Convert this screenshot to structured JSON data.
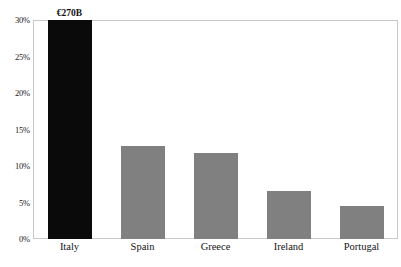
{
  "chart_data": {
    "type": "bar",
    "title": "",
    "subtitle": "",
    "xlabel": "",
    "ylabel": "",
    "categories": [
      "Italy",
      "Spain",
      "Greece",
      "Ireland",
      "Portugal"
    ],
    "values": [
      30.0,
      12.8,
      11.8,
      6.6,
      4.5
    ],
    "value_unit": "%",
    "ylim": [
      0,
      30
    ],
    "ytick_labels": [
      "30%",
      "25%",
      "20%",
      "15%",
      "10%",
      "5%",
      "0%"
    ],
    "ytick_values": [
      30,
      25,
      20,
      15,
      10,
      5,
      0
    ],
    "grid": false,
    "legend": false,
    "series": [
      {
        "name": "Share",
        "values": [
          30.0,
          12.8,
          11.8,
          6.6,
          4.5
        ]
      }
    ],
    "bars": [
      {
        "category": "Italy",
        "value": 30.0,
        "color": "#0a0a0a",
        "annotation": "€270B",
        "clipped_at_top": true
      },
      {
        "category": "Spain",
        "value": 12.8,
        "color": "#808080",
        "annotation": "",
        "clipped_at_top": false
      },
      {
        "category": "Greece",
        "value": 11.8,
        "color": "#808080",
        "annotation": "",
        "clipped_at_top": false
      },
      {
        "category": "Ireland",
        "value": 6.6,
        "color": "#808080",
        "annotation": "",
        "clipped_at_top": false
      },
      {
        "category": "Portugal",
        "value": 4.5,
        "color": "#808080",
        "annotation": "",
        "clipped_at_top": false
      }
    ],
    "annotations": [
      {
        "target": "Italy",
        "text": "€270B"
      }
    ],
    "colors": {
      "highlight_bar": "#0a0a0a",
      "default_bar": "#808080",
      "frame": "#c9c9c9",
      "background": "#ffffff",
      "tick_text": "#222222",
      "category_text": "#141414"
    }
  }
}
